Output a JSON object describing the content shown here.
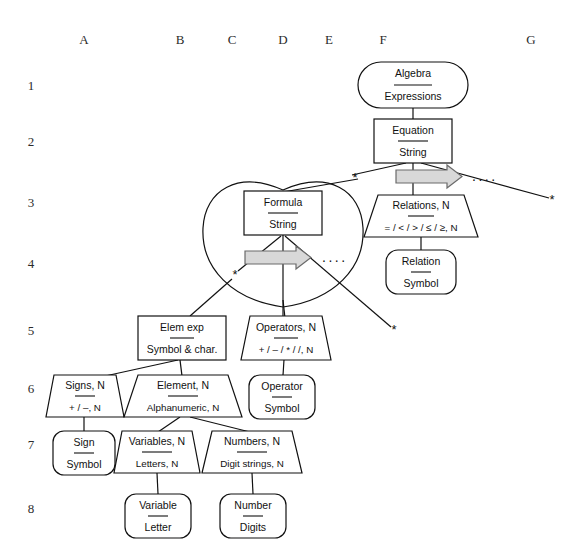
{
  "figure": {
    "grid": {
      "columns": [
        {
          "label": "A",
          "x": 84
        },
        {
          "label": "B",
          "x": 180
        },
        {
          "label": "C",
          "x": 232
        },
        {
          "label": "D",
          "x": 283
        },
        {
          "label": "E",
          "x": 329
        },
        {
          "label": "F",
          "x": 383
        },
        {
          "label": "G",
          "x": 531
        }
      ],
      "rows": [
        {
          "label": "1",
          "y": 85
        },
        {
          "label": "2",
          "y": 141
        },
        {
          "label": "3",
          "y": 202
        },
        {
          "label": "4",
          "y": 263
        },
        {
          "label": "5",
          "y": 330
        },
        {
          "label": "6",
          "y": 388
        },
        {
          "label": "7",
          "y": 444
        },
        {
          "label": "8",
          "y": 508
        }
      ]
    },
    "nodes": [
      {
        "id": "algebra",
        "shape": "stadium",
        "title": "Algebra",
        "subtitle": "Expressions",
        "cx": 413,
        "cy": 85,
        "w": 110,
        "h": 46
      },
      {
        "id": "equation",
        "shape": "rect",
        "title": "Equation",
        "subtitle": "String",
        "cx": 413,
        "cy": 141,
        "w": 78,
        "h": 44
      },
      {
        "id": "relations",
        "shape": "trapezoid",
        "title": "Relations, N",
        "subtitle": "= / < / > / ≤ / ≥, N",
        "cx": 421,
        "cy": 215,
        "w": 110,
        "h": 44
      },
      {
        "id": "relation",
        "shape": "stadium",
        "title": "Relation",
        "subtitle": "Symbol",
        "cx": 421,
        "cy": 272,
        "w": 70,
        "h": 44
      },
      {
        "id": "formula",
        "shape": "rect",
        "title": "Formula",
        "subtitle": "String",
        "cx": 283,
        "cy": 213,
        "w": 78,
        "h": 44
      },
      {
        "id": "elemexp",
        "shape": "rect",
        "title": "Elem exp",
        "subtitle": "Symbol & char.",
        "cx": 182,
        "cy": 338,
        "w": 88,
        "h": 44
      },
      {
        "id": "operators",
        "shape": "trapezoid",
        "title": "Operators, N",
        "subtitle": "+ / – / * / /, N",
        "cx": 285,
        "cy": 338,
        "w": 86,
        "h": 44
      },
      {
        "id": "signs",
        "shape": "trapezoid",
        "title": "Signs, N",
        "subtitle": "+ / –, N",
        "cx": 84,
        "cy": 396,
        "w": 76,
        "h": 42
      },
      {
        "id": "element",
        "shape": "trapezoid",
        "title": "Element, N",
        "subtitle": "Alphanumeric, N",
        "cx": 186,
        "cy": 396,
        "w": 112,
        "h": 42
      },
      {
        "id": "operator",
        "shape": "stadium",
        "title": "Operator",
        "subtitle": "Symbol",
        "cx": 282,
        "cy": 396,
        "w": 66,
        "h": 44
      },
      {
        "id": "sign",
        "shape": "stadium",
        "title": "Sign",
        "subtitle": "Symbol",
        "cx": 84,
        "cy": 452,
        "w": 62,
        "h": 44
      },
      {
        "id": "variables",
        "shape": "trapezoid",
        "title": "Variables, N",
        "subtitle": "Letters, N",
        "cx": 155,
        "cy": 452,
        "w": 82,
        "h": 42
      },
      {
        "id": "numbers",
        "shape": "trapezoid",
        "title": "Numbers, N",
        "subtitle": "Digit strings, N",
        "cx": 252,
        "cy": 452,
        "w": 104,
        "h": 42
      },
      {
        "id": "variable",
        "shape": "stadium",
        "title": "Variable",
        "subtitle": "Letter",
        "cx": 158,
        "cy": 516,
        "w": 66,
        "h": 44
      },
      {
        "id": "number",
        "shape": "stadium",
        "title": "Number",
        "subtitle": "Digits",
        "cx": 253,
        "cy": 516,
        "w": 66,
        "h": 44
      }
    ],
    "annotations": {
      "asterisk": "*",
      "ellipsis": "....",
      "stars": [
        {
          "x": 355,
          "y": 178
        },
        {
          "x": 552,
          "y": 200
        },
        {
          "x": 235,
          "y": 275
        },
        {
          "x": 394,
          "y": 330
        }
      ],
      "ellipses_marks": [
        {
          "x": 484,
          "y": 177
        },
        {
          "x": 334,
          "y": 258
        }
      ]
    }
  }
}
